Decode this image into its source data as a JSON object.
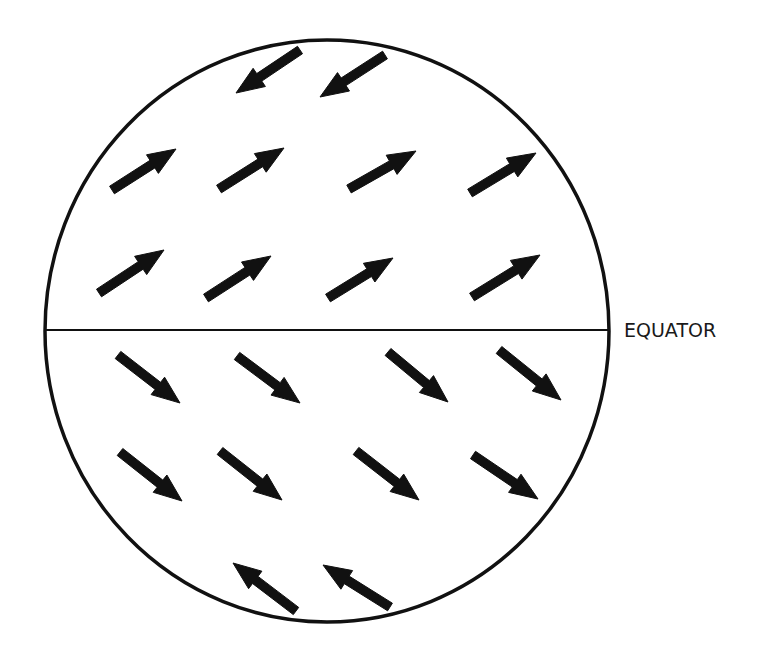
{
  "diagram": {
    "equator_label": "EQUATOR",
    "colors": {
      "stroke": "#111111",
      "background": "#ffffff",
      "text": "#1a1a1a"
    },
    "globe": {
      "cx": 327,
      "cy": 331,
      "rx": 282,
      "ry": 291
    },
    "equator_line": {
      "x1": 46,
      "y1": 330,
      "x2": 609,
      "y2": 330
    },
    "equator_label_pos": {
      "x": 624,
      "y": 337
    },
    "arrows": [
      {
        "id": "n-top-1",
        "direction": "down-left",
        "x1": 300,
        "y1": 50,
        "x2": 236,
        "y2": 93
      },
      {
        "id": "n-top-2",
        "direction": "down-left",
        "x1": 385,
        "y1": 55,
        "x2": 320,
        "y2": 97
      },
      {
        "id": "n-mid-1",
        "direction": "up-right",
        "x1": 112,
        "y1": 190,
        "x2": 176,
        "y2": 149
      },
      {
        "id": "n-mid-2",
        "direction": "up-right",
        "x1": 219,
        "y1": 189,
        "x2": 284,
        "y2": 148
      },
      {
        "id": "n-mid-3",
        "direction": "up-right",
        "x1": 349,
        "y1": 189,
        "x2": 416,
        "y2": 151
      },
      {
        "id": "n-mid-4",
        "direction": "up-right",
        "x1": 470,
        "y1": 193,
        "x2": 536,
        "y2": 153
      },
      {
        "id": "n-low-1",
        "direction": "up-right",
        "x1": 99,
        "y1": 293,
        "x2": 164,
        "y2": 250
      },
      {
        "id": "n-low-2",
        "direction": "up-right",
        "x1": 206,
        "y1": 298,
        "x2": 271,
        "y2": 256
      },
      {
        "id": "n-low-3",
        "direction": "up-right",
        "x1": 328,
        "y1": 298,
        "x2": 393,
        "y2": 258
      },
      {
        "id": "n-low-4",
        "direction": "up-right",
        "x1": 472,
        "y1": 297,
        "x2": 540,
        "y2": 255
      },
      {
        "id": "s-low-1",
        "direction": "down-right",
        "x1": 118,
        "y1": 355,
        "x2": 180,
        "y2": 403
      },
      {
        "id": "s-low-2",
        "direction": "down-right",
        "x1": 237,
        "y1": 356,
        "x2": 300,
        "y2": 403
      },
      {
        "id": "s-low-3",
        "direction": "down-right",
        "x1": 388,
        "y1": 352,
        "x2": 448,
        "y2": 402
      },
      {
        "id": "s-low-4",
        "direction": "down-right",
        "x1": 499,
        "y1": 350,
        "x2": 561,
        "y2": 400
      },
      {
        "id": "s-mid-1",
        "direction": "down-right",
        "x1": 120,
        "y1": 452,
        "x2": 182,
        "y2": 501
      },
      {
        "id": "s-mid-2",
        "direction": "down-right",
        "x1": 220,
        "y1": 451,
        "x2": 282,
        "y2": 500
      },
      {
        "id": "s-mid-3",
        "direction": "down-right",
        "x1": 356,
        "y1": 451,
        "x2": 419,
        "y2": 500
      },
      {
        "id": "s-mid-4",
        "direction": "down-right",
        "x1": 473,
        "y1": 455,
        "x2": 538,
        "y2": 499
      },
      {
        "id": "s-bot-1",
        "direction": "up-left",
        "x1": 296,
        "y1": 611,
        "x2": 233,
        "y2": 563
      },
      {
        "id": "s-bot-2",
        "direction": "up-left",
        "x1": 390,
        "y1": 607,
        "x2": 323,
        "y2": 565
      }
    ]
  }
}
